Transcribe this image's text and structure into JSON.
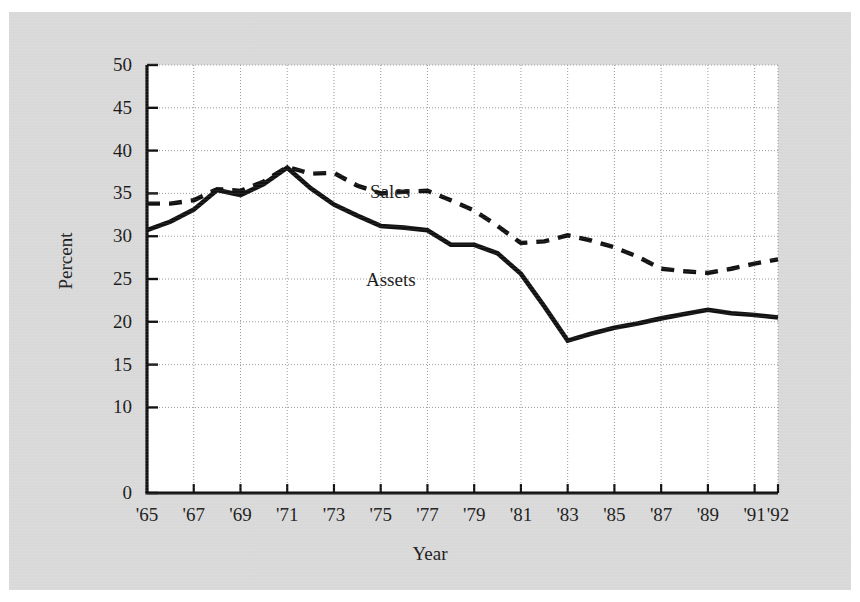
{
  "figure": {
    "background_color": "#d9d9d9",
    "plot_background_color": "#ffffff",
    "line_color": "#111111"
  },
  "chart_data": {
    "type": "line",
    "title": "",
    "xlabel": "Year",
    "ylabel": "Percent",
    "xlim": [
      1965,
      1992
    ],
    "ylim": [
      0,
      50
    ],
    "grid": true,
    "legend_position": "inline-annotation",
    "x_tick_labels": [
      "'65",
      "'67",
      "'69",
      "'71",
      "'73",
      "'75",
      "'77",
      "'79",
      "'81",
      "'83",
      "'85",
      "'87",
      "'89",
      "'91",
      "'92"
    ],
    "x_tick_values": [
      1965,
      1967,
      1969,
      1971,
      1973,
      1975,
      1977,
      1979,
      1981,
      1983,
      1985,
      1987,
      1989,
      1991,
      1992
    ],
    "y_tick_labels": [
      "0",
      "10",
      "15",
      "20",
      "25",
      "30",
      "35",
      "40",
      "45",
      "50"
    ],
    "y_tick_values": [
      0,
      10,
      15,
      20,
      25,
      30,
      35,
      40,
      45,
      50
    ],
    "x": [
      1965,
      1966,
      1967,
      1968,
      1969,
      1970,
      1971,
      1972,
      1973,
      1974,
      1975,
      1976,
      1977,
      1978,
      1979,
      1980,
      1981,
      1982,
      1983,
      1984,
      1985,
      1986,
      1987,
      1988,
      1989,
      1990,
      1991,
      1992
    ],
    "series": [
      {
        "name": "Sales",
        "style": "dashed",
        "values": [
          33.8,
          33.8,
          34.2,
          35.5,
          35.3,
          36.4,
          38.1,
          37.3,
          37.4,
          35.9,
          35.0,
          35.2,
          35.3,
          34.2,
          33.0,
          31.2,
          29.2,
          29.4,
          30.1,
          29.5,
          28.7,
          27.6,
          26.2,
          25.9,
          25.7,
          26.2,
          26.8,
          27.3
        ]
      },
      {
        "name": "Assets",
        "style": "solid",
        "values": [
          30.7,
          31.7,
          33.1,
          35.4,
          34.8,
          36.1,
          38.0,
          35.6,
          33.7,
          32.4,
          31.2,
          31.0,
          30.7,
          29.0,
          29.0,
          28.0,
          25.6,
          21.8,
          17.8,
          18.6,
          19.3,
          19.8,
          20.4,
          20.9,
          21.4,
          21.0,
          20.8,
          20.5
        ]
      }
    ],
    "annotations": [
      {
        "text": "Sales",
        "x": 1975,
        "y": 37.0
      },
      {
        "text": "Assets",
        "x": 1975,
        "y": 27.5
      }
    ]
  }
}
